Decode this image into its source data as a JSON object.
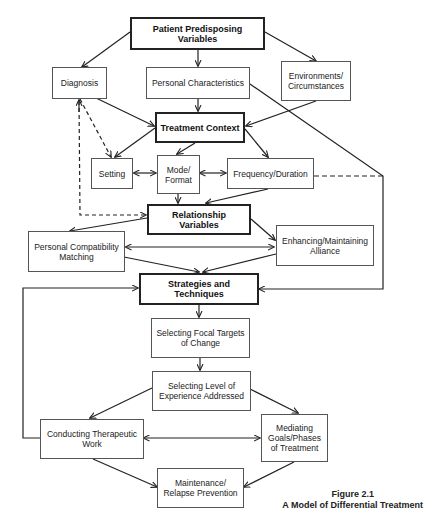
{
  "nodes": {
    "patient_predisposing": "Patient Predisposing Variables",
    "diagnosis": "Diagnosis",
    "personal_characteristics": "Personal Characteristics",
    "environments": "Environments/ Circumstances",
    "treatment_context": "Treatment Context",
    "setting": "Setting",
    "mode_format": "Mode/ Format",
    "frequency_duration": "Frequency/Duration",
    "relationship_variables": "Relationship Variables",
    "personal_compatibility": "Personal Compatibility Matching",
    "enhancing_alliance": "Enhancing/Maintaining Alliance",
    "strategies": "Strategies and Techniques",
    "selecting_focal": "Selecting Focal Targets of Change",
    "selecting_level": "Selecting Level of Experience Addressed",
    "conducting_work": "Conducting Therapeutic Work",
    "mediating_goals": "Mediating Goals/Phases of Treatment",
    "maintenance": "Maintenance/ Relapse Prevention"
  },
  "edges": [
    {
      "from": "patient_predisposing",
      "to": "diagnosis",
      "style": "solid"
    },
    {
      "from": "patient_predisposing",
      "to": "personal_characteristics",
      "style": "solid"
    },
    {
      "from": "patient_predisposing",
      "to": "environments",
      "style": "solid"
    },
    {
      "from": "diagnosis",
      "to": "treatment_context",
      "style": "solid"
    },
    {
      "from": "personal_characteristics",
      "to": "treatment_context",
      "style": "solid"
    },
    {
      "from": "environments",
      "to": "treatment_context",
      "style": "solid"
    },
    {
      "from": "diagnosis",
      "to": "setting",
      "style": "dashed"
    },
    {
      "from": "diagnosis",
      "to": "relationship_variables",
      "style": "dashed"
    },
    {
      "from": "treatment_context",
      "to": "setting",
      "style": "solid"
    },
    {
      "from": "treatment_context",
      "to": "mode_format",
      "style": "solid"
    },
    {
      "from": "treatment_context",
      "to": "frequency_duration",
      "style": "solid"
    },
    {
      "from": "setting",
      "to": "mode_format",
      "style": "bidirectional"
    },
    {
      "from": "mode_format",
      "to": "frequency_duration",
      "style": "bidirectional"
    },
    {
      "from": "mode_format",
      "to": "relationship_variables",
      "style": "solid"
    },
    {
      "from": "frequency_duration",
      "to": "relationship_variables",
      "style": "solid"
    },
    {
      "from": "personal_characteristics",
      "to": "strategies",
      "style": "solid"
    },
    {
      "from": "frequency_duration",
      "to": "strategies",
      "style": "dashed"
    },
    {
      "from": "relationship_variables",
      "to": "personal_compatibility",
      "style": "solid"
    },
    {
      "from": "relationship_variables",
      "to": "enhancing_alliance",
      "style": "solid"
    },
    {
      "from": "personal_compatibility",
      "to": "enhancing_alliance",
      "style": "bidirectional"
    },
    {
      "from": "personal_compatibility",
      "to": "strategies",
      "style": "solid"
    },
    {
      "from": "enhancing_alliance",
      "to": "strategies",
      "style": "solid"
    },
    {
      "from": "strategies",
      "to": "selecting_focal",
      "style": "solid"
    },
    {
      "from": "selecting_focal",
      "to": "selecting_level",
      "style": "solid"
    },
    {
      "from": "selecting_level",
      "to": "conducting_work",
      "style": "solid"
    },
    {
      "from": "selecting_level",
      "to": "mediating_goals",
      "style": "solid"
    },
    {
      "from": "conducting_work",
      "to": "mediating_goals",
      "style": "bidirectional"
    },
    {
      "from": "conducting_work",
      "to": "maintenance",
      "style": "solid"
    },
    {
      "from": "mediating_goals",
      "to": "maintenance",
      "style": "solid"
    },
    {
      "from": "conducting_work",
      "to": "strategies",
      "style": "solid"
    }
  ],
  "caption": {
    "figure": "Figure 2.1",
    "title": "A Model of Differential Treatment"
  }
}
